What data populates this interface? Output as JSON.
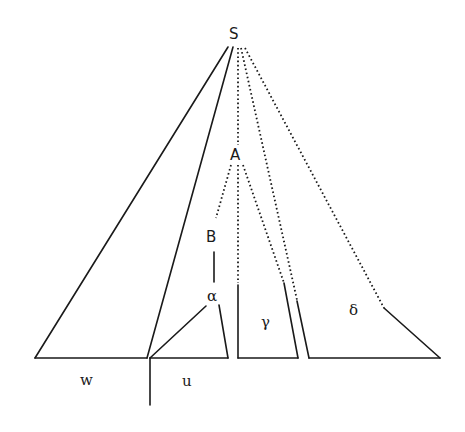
{
  "diagram": {
    "type": "parse-tree-derivation",
    "nodes": {
      "root": "S",
      "intermediate": "A",
      "inner": "B"
    },
    "subtrees": {
      "alpha": "α",
      "gamma": "γ",
      "delta": "δ"
    },
    "yield_labels": {
      "w": "w",
      "u": "u"
    }
  }
}
